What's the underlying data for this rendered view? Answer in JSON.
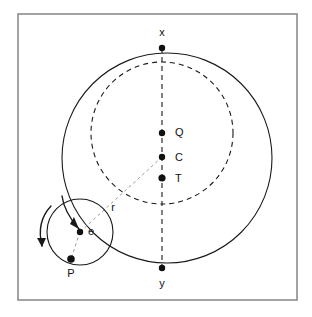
{
  "figure": {
    "type": "astronomical-epicycle-diagram",
    "title": "",
    "background_color": "#ffffff",
    "stroke_color": "#1a1a1a",
    "frame_color": "#8c8c8c"
  },
  "frame": {
    "x": 18,
    "y": 14,
    "width": 279,
    "height": 286,
    "stroke": "#8c8c8c",
    "stroke_width": 1.6,
    "fill": "#ffffff"
  },
  "circles": [
    {
      "name": "deferent-circle",
      "label": "deferent",
      "cx": 167,
      "cy": 158,
      "r": 105,
      "style": "solid",
      "stroke": "#1a1a1a",
      "stroke_width": 1.1,
      "fill": "none"
    },
    {
      "name": "dashed-circle",
      "label": "equant-circle",
      "cx": 162,
      "cy": 133,
      "r": 71,
      "style": "dashed",
      "dash": "5,4",
      "stroke": "#1a1a1a",
      "stroke_width": 1.1,
      "fill": "none"
    },
    {
      "name": "epicycle-circle",
      "label": "epicycle",
      "cx": 80,
      "cy": 232,
      "r": 33,
      "style": "solid",
      "stroke": "#1a1a1a",
      "stroke_width": 1.1,
      "fill": "none"
    }
  ],
  "lines": [
    {
      "name": "apsidal-line",
      "label": "x-y axis",
      "x1": 162,
      "y1": 48,
      "x2": 162,
      "y2": 268,
      "style": "dashed",
      "dash": "5,4",
      "stroke": "#1a1a1a",
      "stroke_width": 1.1
    },
    {
      "name": "radius-line-r",
      "label": "r",
      "x1": 162,
      "y1": 157,
      "x2": 80,
      "y2": 232,
      "style": "dashed",
      "dash": "3,3",
      "stroke": "#9a9a9a",
      "stroke_width": 1.0
    },
    {
      "name": "epicycle-radius-line",
      "label": "e to P",
      "x1": 80,
      "y1": 232,
      "x2": 71,
      "y2": 259,
      "style": "dashed",
      "dash": "3,3",
      "stroke": "#9a9a9a",
      "stroke_width": 1.0
    }
  ],
  "points": [
    {
      "name": "point-x",
      "label": "x",
      "cx": 162,
      "cy": 48,
      "r": 3.2,
      "label_x": 162,
      "label_y": 33,
      "anchor": "middle"
    },
    {
      "name": "point-Q",
      "label": "Q",
      "cx": 162,
      "cy": 133,
      "r": 3.2,
      "label_x": 175,
      "label_y": 133,
      "anchor": "start"
    },
    {
      "name": "point-C",
      "label": "C",
      "cx": 162,
      "cy": 157,
      "r": 3.2,
      "label_x": 175,
      "label_y": 158,
      "anchor": "start"
    },
    {
      "name": "point-T",
      "label": "T",
      "cx": 162,
      "cy": 178,
      "r": 3.6,
      "label_x": 175,
      "label_y": 179,
      "anchor": "start"
    },
    {
      "name": "point-e",
      "label": "e",
      "cx": 80,
      "cy": 232,
      "r": 3.2,
      "label_x": 88,
      "label_y": 232,
      "anchor": "start"
    },
    {
      "name": "point-P",
      "label": "P",
      "cx": 71,
      "cy": 259,
      "r": 3.8,
      "label_x": 71,
      "label_y": 274,
      "anchor": "middle"
    },
    {
      "name": "point-y",
      "label": "y",
      "cx": 162,
      "cy": 268,
      "r": 3.2,
      "label_x": 162,
      "label_y": 284,
      "anchor": "middle"
    }
  ],
  "annotations": [
    {
      "name": "radius-label-r",
      "label": "r",
      "x": 113,
      "y": 208,
      "anchor": "middle"
    }
  ],
  "arrows": [
    {
      "name": "epicycle-rotation-arrow-inner",
      "label": "inner rotation arrow",
      "path": "M 62 196 Q 64 212 79 229",
      "stroke": "#1a1a1a",
      "stroke_width": 1.4,
      "head": "M 79 229 L 72 223 L 76 218 Z"
    },
    {
      "name": "epicycle-rotation-arrow-outer",
      "label": "outer rotation arrow",
      "path": "M 51 206 Q 36 222 42 246",
      "stroke": "#1a1a1a",
      "stroke_width": 1.4,
      "head": "M 42 246 L 39 238 L 46 238 Z"
    }
  ],
  "labels_list": [
    "x",
    "Q",
    "C",
    "T",
    "r",
    "e",
    "P",
    "y"
  ]
}
